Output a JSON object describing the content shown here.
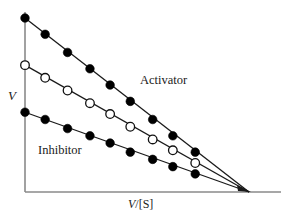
{
  "chart_data": {
    "type": "line",
    "title": "",
    "subtitle": "",
    "xlabel": "V/[S]",
    "ylabel": "V",
    "xlabel_parts": {
      "italic": "V",
      "plain": "/[S]"
    },
    "grid": false,
    "legend_position": "inline-annotations",
    "axis_color": "#8a8a8a",
    "line_color": "#1a1a1a",
    "xlim": [
      0,
      10
    ],
    "ylim": [
      0,
      10
    ],
    "note": "Eadie-Hofstee style plot: three straight lines with a common x-intercept, differing y-intercepts",
    "common_x_intercept": 10,
    "series": [
      {
        "name": "Activator",
        "marker": "filled-circle",
        "marker_fill": "#000000",
        "y_intercept": 9.6,
        "x": [
          0,
          0.9,
          1.9,
          2.9,
          3.8,
          4.7,
          5.7,
          6.6,
          7.6
        ],
        "y": [
          9.6,
          8.7,
          7.7,
          6.8,
          5.9,
          5.0,
          4.0,
          3.1,
          2.2
        ]
      },
      {
        "name": "Control",
        "marker": "open-circle",
        "marker_fill": "#ffffff",
        "y_intercept": 7.0,
        "x": [
          0,
          0.9,
          1.9,
          2.9,
          3.8,
          4.7,
          5.7,
          6.6,
          7.6
        ],
        "y": [
          7.0,
          6.3,
          5.6,
          4.9,
          4.3,
          3.6,
          2.9,
          2.3,
          1.6
        ]
      },
      {
        "name": "Inhibitor",
        "marker": "filled-circle",
        "marker_fill": "#000000",
        "y_intercept": 4.4,
        "x": [
          0,
          0.9,
          1.9,
          2.9,
          3.8,
          4.7,
          5.7,
          6.6,
          7.6
        ],
        "y": [
          4.4,
          4.0,
          3.5,
          3.1,
          2.7,
          2.2,
          1.8,
          1.4,
          1.0
        ]
      }
    ],
    "annotations": [
      {
        "text": "Activator",
        "series": "Activator"
      },
      {
        "text": "Inhibitor",
        "series": "Inhibitor"
      }
    ]
  },
  "axes": {
    "x_axis_label": "V/[S]",
    "y_axis_label": "V",
    "x_axis_italic_part": "V",
    "x_axis_plain_part": "/[S]"
  },
  "labels": {
    "activator": "Activator",
    "inhibitor": "Inhibitor"
  }
}
